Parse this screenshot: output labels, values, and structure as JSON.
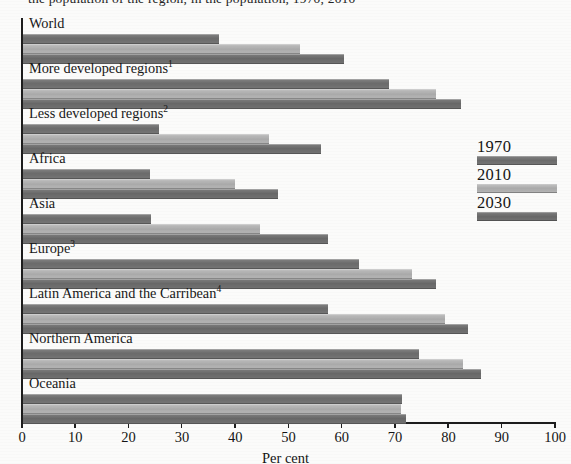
{
  "caption_fragment": "the population of the region, in the population, 1970, 2010",
  "chart_data": {
    "type": "bar",
    "orientation": "horizontal",
    "title": "",
    "xlabel": "Per cent",
    "ylabel": "",
    "xlim": [
      0,
      100
    ],
    "xticks": [
      0,
      10,
      20,
      30,
      40,
      50,
      60,
      70,
      80,
      90,
      100
    ],
    "xtick_labels": [
      "0",
      "10",
      "20",
      "30",
      "40",
      "50",
      "60",
      "70",
      "80",
      "90",
      "100"
    ],
    "grid": false,
    "legend_position": "right",
    "legend": [
      "1970",
      "2010",
      "2030"
    ],
    "categories": [
      "World",
      "More developed regions",
      "Less developed regions",
      "Africa",
      "Asia",
      "Europe",
      "Latin America and the Carribean",
      "Northern America",
      "Oceania"
    ],
    "category_footnotes": [
      "",
      "1",
      "2",
      "",
      "",
      "3",
      "4",
      "",
      ""
    ],
    "series": [
      {
        "name": "1970",
        "color": "#6f6f6f",
        "values": [
          36.7,
          68.6,
          25.6,
          23.9,
          24.1,
          63.1,
          57.3,
          74.3,
          71.1
        ]
      },
      {
        "name": "2010",
        "color": "#b0b0b0",
        "values": [
          51.9,
          77.4,
          46.2,
          39.7,
          44.4,
          73.0,
          79.1,
          82.5,
          70.9
        ]
      },
      {
        "name": "2030",
        "color": "#6c6c6c",
        "values": [
          60.3,
          82.1,
          56.0,
          47.9,
          57.3,
          77.5,
          83.5,
          86.0,
          71.8
        ]
      }
    ]
  }
}
